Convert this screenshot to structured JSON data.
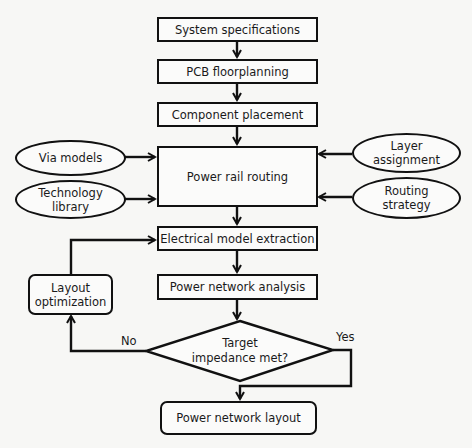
{
  "diagram": {
    "type": "flowchart",
    "main_flow": [
      {
        "id": "system_specifications",
        "label": "System specifications"
      },
      {
        "id": "pcb_floorplanning",
        "label": "PCB floorplanning"
      },
      {
        "id": "component_placement",
        "label": "Component placement"
      },
      {
        "id": "power_rail_routing",
        "label": "Power rail routing"
      },
      {
        "id": "electrical_model_extraction",
        "label": "Electrical model extraction"
      },
      {
        "id": "power_network_analysis",
        "label": "Power network analysis"
      }
    ],
    "inputs_left": [
      {
        "id": "via_models",
        "label": "Via models"
      },
      {
        "id": "technology_library",
        "label_line1": "Technology",
        "label_line2": "library"
      }
    ],
    "inputs_right": [
      {
        "id": "layer_assignment",
        "label_line1": "Layer",
        "label_line2": "assignment"
      },
      {
        "id": "routing_strategy",
        "label_line1": "Routing",
        "label_line2": "strategy"
      }
    ],
    "decision": {
      "label_line1": "Target",
      "label_line2": "impedance met?",
      "no_label": "No",
      "yes_label": "Yes"
    },
    "feedback": {
      "label_line1": "Layout",
      "label_line2": "optimization"
    },
    "output": {
      "label": "Power network layout"
    },
    "edges": [
      [
        "System specifications",
        "PCB floorplanning"
      ],
      [
        "PCB floorplanning",
        "Component placement"
      ],
      [
        "Component placement",
        "Power rail routing"
      ],
      [
        "Via models",
        "Power rail routing"
      ],
      [
        "Technology library",
        "Power rail routing"
      ],
      [
        "Layer assignment",
        "Power rail routing"
      ],
      [
        "Routing strategy",
        "Power rail routing"
      ],
      [
        "Power rail routing",
        "Electrical model extraction"
      ],
      [
        "Electrical model extraction",
        "Power network analysis"
      ],
      [
        "Power network analysis",
        "Target impedance met?"
      ],
      [
        "Target impedance met?",
        "Layout optimization",
        "No"
      ],
      [
        "Layout optimization",
        "Electrical model extraction"
      ],
      [
        "Target impedance met?",
        "Power network layout",
        "Yes"
      ]
    ]
  }
}
